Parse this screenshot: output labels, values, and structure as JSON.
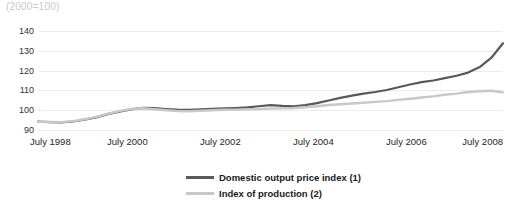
{
  "chart_data": {
    "type": "line",
    "title": "(2000=100)",
    "xlabel": "",
    "ylabel": "",
    "ylim": [
      90,
      140
    ],
    "yticks": [
      90,
      100,
      110,
      120,
      130,
      140
    ],
    "ytick_labels": [
      "90",
      "100",
      "110",
      "120",
      "130",
      "140"
    ],
    "grid": true,
    "legend_position": "bottom-center",
    "xlim": [
      "July 1998",
      "July 2008"
    ],
    "xticks": [
      "July 1998",
      "July 2000",
      "July 2002",
      "July 2004",
      "July 2006",
      "July 2008"
    ],
    "x": [
      "1998-07",
      "1998-10",
      "1999-01",
      "1999-04",
      "1999-07",
      "1999-10",
      "2000-01",
      "2000-04",
      "2000-07",
      "2000-10",
      "2001-01",
      "2001-04",
      "2001-07",
      "2001-10",
      "2002-01",
      "2002-04",
      "2002-07",
      "2002-10",
      "2003-01",
      "2003-04",
      "2003-07",
      "2003-10",
      "2004-01",
      "2004-04",
      "2004-07",
      "2004-10",
      "2005-01",
      "2005-04",
      "2005-07",
      "2005-10",
      "2006-01",
      "2006-04",
      "2006-07",
      "2006-10",
      "2007-01",
      "2007-04",
      "2007-07",
      "2007-10",
      "2008-01",
      "2008-04",
      "2008-07"
    ],
    "series": [
      {
        "name": "Domestic output price index (1)",
        "color": "#595959",
        "width": 2.2,
        "values": [
          94.2,
          94.0,
          93.8,
          94.3,
          95.2,
          96.4,
          98.0,
          99.3,
          100.4,
          101.2,
          101.0,
          100.6,
          100.3,
          100.2,
          100.4,
          100.7,
          100.9,
          101.1,
          101.4,
          102.0,
          102.6,
          102.2,
          102.0,
          102.6,
          103.6,
          104.9,
          106.2,
          107.4,
          108.4,
          109.2,
          110.2,
          111.6,
          113.0,
          114.2,
          115.0,
          116.2,
          117.4,
          119.0,
          121.8,
          126.5,
          133.8
        ]
      },
      {
        "name": "Index of production (2)",
        "color": "#c8c8c8",
        "width": 2.4,
        "values": [
          94.2,
          94.1,
          94.0,
          94.5,
          95.4,
          96.6,
          98.2,
          99.5,
          100.6,
          101.0,
          100.5,
          100.0,
          99.6,
          99.5,
          99.7,
          100.0,
          100.2,
          100.3,
          100.4,
          100.6,
          100.8,
          100.9,
          101.1,
          101.5,
          102.0,
          102.6,
          103.0,
          103.4,
          103.8,
          104.2,
          104.6,
          105.2,
          105.8,
          106.4,
          107.0,
          107.8,
          108.4,
          109.2,
          109.6,
          109.8,
          109.0
        ]
      }
    ]
  },
  "legend": {
    "items": [
      {
        "label": "Domestic output price index (1)"
      },
      {
        "label": "Index of production (2)"
      }
    ]
  }
}
